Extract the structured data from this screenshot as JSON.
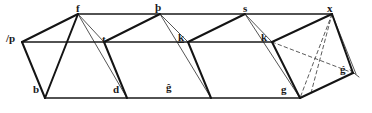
{
  "figure": {
    "stroke_color": "#1a1a1a",
    "hidden_stroke_color": "#555555",
    "background_color": "#ffffff",
    "labels": [
      {
        "id": "label-slash-p",
        "text": "/p",
        "x": 6,
        "y": 33,
        "underlined": false
      },
      {
        "id": "label-f",
        "text": "f",
        "x": 76,
        "y": 3,
        "underlined": false
      },
      {
        "id": "label-thorn",
        "text": "þ",
        "x": 155,
        "y": 2,
        "underlined": false
      },
      {
        "id": "label-s",
        "text": "s",
        "x": 243,
        "y": 3,
        "underlined": false
      },
      {
        "id": "label-x",
        "text": "x",
        "x": 327,
        "y": 3,
        "underlined": false
      },
      {
        "id": "label-t",
        "text": "t",
        "x": 102,
        "y": 34,
        "underlined": false
      },
      {
        "id": "label-k1",
        "text": "k",
        "x": 178,
        "y": 32,
        "underlined": true
      },
      {
        "id": "label-k2",
        "text": "k",
        "x": 261,
        "y": 32,
        "underlined": false
      },
      {
        "id": "label-b",
        "text": "b",
        "x": 33,
        "y": 84,
        "underlined": false
      },
      {
        "id": "label-d",
        "text": "d",
        "x": 113,
        "y": 84,
        "underlined": false
      },
      {
        "id": "label-g-hat",
        "text": "ĝ",
        "x": 166,
        "y": 82,
        "underlined": false
      },
      {
        "id": "label-g",
        "text": "g",
        "x": 281,
        "y": 84,
        "underlined": false
      },
      {
        "id": "label-g-acute",
        "text": "ǵ",
        "x": 340,
        "y": 64,
        "underlined": false
      }
    ],
    "edges": {
      "top_rail": "M 78 14 L 332 14",
      "middle_rail": "M 22 42 L 272 42",
      "bottom_rail": "M 45 98 L 300 98",
      "solid_heavy": [
        "M 22 42 L 78 14",
        "M 22 42 L 45 98",
        "M 78 14 L 45 98",
        "M 104 42 L 160 14",
        "M 104 42 L 127 98",
        "M 160 14 L 127 98",
        "M 188 42 L 245 14",
        "M 188 42 L 211 98",
        "M 245 14 L 211 98",
        "M 272 42 L 332 14",
        "M 272 42 L 300 98",
        "M 332 14 L 300 98",
        "M 300 98 L 352 72",
        "M 332 14 L 352 72"
      ],
      "solid_light": [
        "M 78 14 L 104 42",
        "M 45 98 L 127 98",
        "M 160 14 L 188 42",
        "M 127 98 L 211 98",
        "M 245 14 L 272 42",
        "M 211 98 L 300 98",
        "M 78 14 L 127 98",
        "M 160 14 L 211 98",
        "M 245 14 L 300 98",
        "M 332 14 L 356 74",
        "M 352 72 L 358 76"
      ],
      "hidden_dashed": [
        "M 332 14 L 300 98",
        "M 272 42 L 352 72",
        "M 332 14 L 310 92"
      ]
    }
  }
}
